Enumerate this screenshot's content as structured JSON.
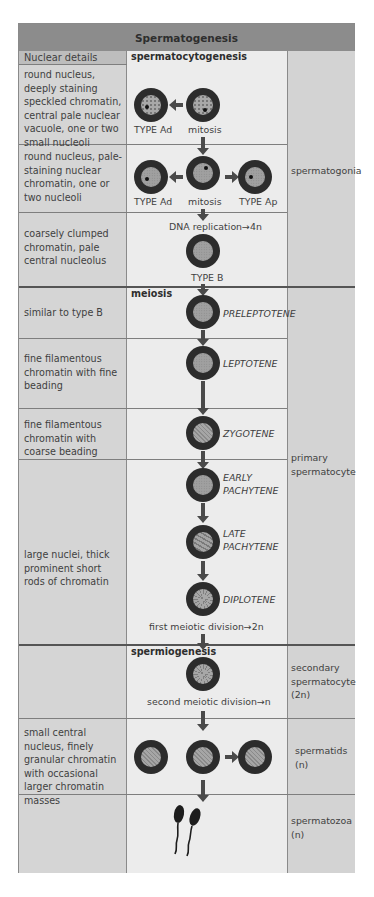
{
  "title": "Spermatogenesis",
  "header": {
    "nuclear_details": "Nuclear details"
  },
  "sections": {
    "spermatocytogenesis": "spermatocytogenesis",
    "meiosis": "meiosis",
    "spermiogenesis": "spermiogenesis"
  },
  "rows": [
    {
      "nuclear": "round nucleus, deeply staining speckled chromatin, central pale nuclear vacuole, one or two small nucleoli",
      "labels": [
        "TYPE Ad",
        "mitosis"
      ]
    },
    {
      "nuclear": "round nucleus, pale-staining nuclear chromatin, one or two nucleoli",
      "labels": [
        "TYPE Ad",
        "mitosis",
        "TYPE Ap"
      ]
    },
    {
      "nuclear": "coarsely clumped chromatin, pale central nucleolus",
      "above": "DNA replication→4n",
      "labels": [
        "TYPE B"
      ]
    },
    {
      "nuclear": "similar to type B",
      "stage": "PRELEPTOTENE"
    },
    {
      "nuclear": "fine filamentous chromatin with fine beading",
      "stage": "LEPTOTENE"
    },
    {
      "nuclear": "fine filamentous chromatin with coarse beading",
      "stage": "ZYGOTENE"
    },
    {
      "nuclear": "large nuclei, thick prominent short rods of chromatin",
      "stages": [
        "EARLY PACHYTENE",
        "LATE PACHYTENE",
        "DIPLOTENE"
      ],
      "below": "first meiotic division→2n"
    },
    {
      "nuclear": "",
      "below": "second meiotic division→n"
    },
    {
      "nuclear": "small central nucleus, finely granular chromatin with occasional larger chromatin masses"
    },
    {
      "nuclear": ""
    }
  ],
  "cell_types": {
    "spermatogonia": "spermatogonia",
    "primary": "primary spermatocyte",
    "secondary": "secondary spermatocyte (2n)",
    "spermatids": "spermatids (n)",
    "spermatozoa": "spermatozoa (n)"
  }
}
